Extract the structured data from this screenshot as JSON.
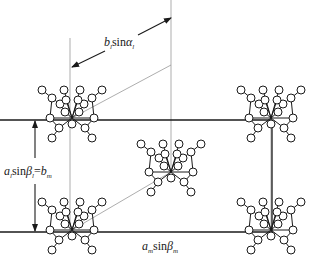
{
  "figure": {
    "colors": {
      "line": "#1a1a1a",
      "thin_line": "#8a8a8a",
      "node_fill": "#ffffff"
    },
    "cell": {
      "left": 70,
      "top": 120,
      "right": 272,
      "bottom": 232
    },
    "molecules": [
      {
        "id": "top-left",
        "cx": 72,
        "cy": 118
      },
      {
        "id": "top-right",
        "cx": 271,
        "cy": 118
      },
      {
        "id": "center",
        "cx": 171,
        "cy": 172
      },
      {
        "id": "bottom-left",
        "cx": 72,
        "cy": 230
      },
      {
        "id": "bottom-right",
        "cx": 271,
        "cy": 230
      }
    ],
    "labels": {
      "top": {
        "base": "b",
        "sub1": "l",
        "func": "sin",
        "greek": "α",
        "sub2": "l"
      },
      "left": {
        "base": "a",
        "sub1": "l",
        "func": "sin",
        "greek": "β",
        "sub2": "l",
        "eq": "=",
        "rhs": "b",
        "rhs_sub": "m"
      },
      "bottom": {
        "base": "a",
        "sub1": "m",
        "func": "sin",
        "greek": "β",
        "sub2": "m"
      }
    }
  }
}
